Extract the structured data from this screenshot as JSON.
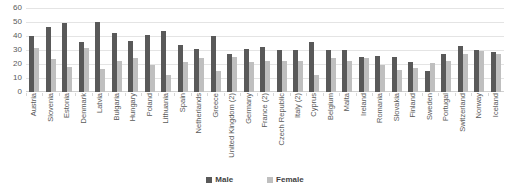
{
  "chart_data": {
    "type": "bar",
    "title": "",
    "xlabel": "",
    "ylabel": "",
    "ylim": [
      0,
      60
    ],
    "yticks": [
      60,
      50,
      40,
      30,
      20,
      10,
      0
    ],
    "grid": true,
    "legend_position": "bottom-center",
    "categories": [
      "Austria",
      "Slovenia",
      "Estonia",
      "Denmark",
      "Latvia",
      "Bulgaria",
      "Hungary",
      "Poland",
      "Lithuania",
      "Spain",
      "Netherlands",
      "Greece",
      "United Kingdom (2)",
      "Germany",
      "France (2)",
      "Czech Republic",
      "Italy (2)",
      "Cyprus",
      "Belgium",
      "Malta",
      "Ireland",
      "Romania",
      "Slovakia",
      "Finland",
      "Sweden",
      "Portugal",
      "Switzerland",
      "Norway",
      "Iceland"
    ],
    "series": [
      {
        "name": "Male",
        "color": "#595959",
        "values": [
          40,
          46.5,
          49.5,
          36,
          50,
          42,
          36.5,
          41,
          43.5,
          33.5,
          31,
          40,
          27,
          30.5,
          32,
          30,
          30,
          36,
          30,
          30,
          25,
          25.5,
          25,
          21.5,
          15,
          27,
          33,
          30,
          28.5
        ]
      },
      {
        "name": "Female",
        "color": "#bfbfbf",
        "values": [
          31.5,
          23.5,
          18,
          31.5,
          16.5,
          22.5,
          24,
          19,
          12.5,
          21.5,
          24,
          15,
          25,
          21.5,
          22,
          22,
          22,
          12,
          24,
          22,
          24,
          19,
          16,
          17.5,
          20.5,
          22.5,
          27,
          29,
          27.5
        ]
      }
    ]
  },
  "legend": {
    "items": [
      {
        "label": "Male"
      },
      {
        "label": "Female"
      }
    ]
  },
  "colors": {
    "male": "#595959",
    "female": "#bfbfbf",
    "gridline": "#e4e4e4",
    "text": "#595959"
  }
}
